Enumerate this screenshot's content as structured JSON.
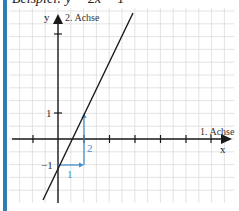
{
  "title": "Beispiel: y = 2x − 1",
  "colors": {
    "border": "#2f7fb5",
    "grid": "#dcdcdc",
    "axis": "#1a1a1a",
    "line": "#1a1a1a",
    "slope_triangle": "#4a90c8"
  },
  "axes": {
    "y_name": "y",
    "y_label": "2. Achse",
    "x_name": "x",
    "x_label": "1. Achse"
  },
  "tick_labels": {
    "y_pos_one": "1",
    "y_neg_one": "−1"
  },
  "slope_triangle": {
    "run_label": "1",
    "rise_label": "2"
  },
  "chart_data": {
    "type": "line",
    "title": "Beispiel: y = 2x − 1",
    "function": "y = 2x - 1",
    "series": [
      {
        "name": "y = 2x − 1",
        "x": [
          -0.6,
          2.9
        ],
        "y": [
          -2.2,
          4.8
        ]
      }
    ],
    "xlabel": "1. Achse (x)",
    "ylabel": "2. Achse (y)",
    "xlim": [
      -2,
      6.7
    ],
    "ylim": [
      -2.4,
      4.9
    ],
    "grid": true,
    "annotations": [
      {
        "type": "slope-triangle",
        "from": [
          0,
          -1
        ],
        "run": 1,
        "rise": 2,
        "run_label": "1",
        "rise_label": "2"
      }
    ]
  }
}
